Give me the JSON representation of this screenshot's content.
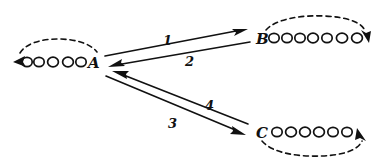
{
  "diagram": {
    "type": "token-passing-state-diagram",
    "title": "",
    "background_color": "#ffffff",
    "ink_color": "#111111",
    "nodes": [
      {
        "id": "A",
        "label": "A",
        "label_x": 88,
        "label_y": 68,
        "token_count": 5,
        "token_side": "left",
        "token_start_x": 22,
        "token_y": 62,
        "token_spacing": 13,
        "self_loop": {
          "direction": "above",
          "arrow_end": "left",
          "style": "dashed"
        }
      },
      {
        "id": "B",
        "label": "B",
        "label_x": 258,
        "label_y": 44,
        "token_count": 7,
        "token_side": "right",
        "token_start_x": 275,
        "token_y": 38,
        "token_spacing": 13,
        "self_loop": {
          "direction": "above",
          "arrow_end": "right",
          "style": "dashed"
        }
      },
      {
        "id": "C",
        "label": "C",
        "label_x": 258,
        "label_y": 138,
        "token_count": 6,
        "token_side": "right",
        "token_start_x": 277,
        "token_y": 132,
        "token_spacing": 13,
        "self_loop": {
          "direction": "below",
          "arrow_end": "right-up",
          "style": "dashed"
        }
      }
    ],
    "edges": [
      {
        "id": "1",
        "label": "1",
        "from": "A",
        "to": "B",
        "label_x": 166,
        "label_y": 42,
        "direction": "A-to-B",
        "arrow_at": "B"
      },
      {
        "id": "2",
        "label": "2",
        "from": "B",
        "to": "A",
        "label_x": 188,
        "label_y": 62,
        "direction": "B-to-A",
        "arrow_at": "A"
      },
      {
        "id": "3",
        "label": "3",
        "from": "A",
        "to": "C",
        "label_x": 172,
        "label_y": 125,
        "direction": "A-to-C",
        "arrow_at": "C"
      },
      {
        "id": "4",
        "label": "4",
        "from": "C",
        "to": "A",
        "label_x": 208,
        "label_y": 107,
        "direction": "C-to-A",
        "arrow_at": "A"
      }
    ]
  }
}
